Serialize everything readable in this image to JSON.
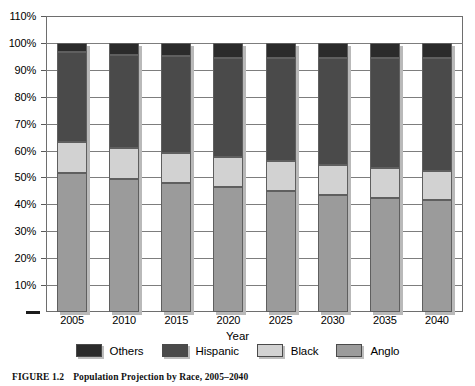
{
  "caption": {
    "number": "FIGURE 1.2",
    "text": "Population Projection by Race, 2005–2040"
  },
  "chart_data": {
    "type": "bar",
    "subtype": "stacked-100-percent",
    "title": "",
    "xlabel": "Year",
    "ylabel": "",
    "categories": [
      "2005",
      "2010",
      "2015",
      "2020",
      "2025",
      "2030",
      "2035",
      "2040"
    ],
    "series": [
      {
        "name": "Anglo",
        "color": "#9b9b9b",
        "values": [
          51.5,
          49.5,
          48.0,
          46.5,
          45.0,
          43.5,
          42.5,
          41.5
        ]
      },
      {
        "name": "Black",
        "color": "#d2d2d2",
        "values": [
          11.5,
          11.5,
          11.0,
          11.0,
          11.0,
          11.0,
          11.0,
          11.0
        ]
      },
      {
        "name": "Hispanic",
        "color": "#4a4a4a",
        "values": [
          33.5,
          34.5,
          36.0,
          37.0,
          38.5,
          40.0,
          41.0,
          42.0
        ]
      },
      {
        "name": "Others",
        "color": "#2b2b2b",
        "values": [
          3.5,
          4.5,
          5.0,
          5.5,
          5.5,
          5.5,
          5.5,
          5.5
        ]
      }
    ],
    "stack_order_bottom_to_top": [
      "Anglo",
      "Black",
      "Hispanic",
      "Others"
    ],
    "legend_order": [
      "Others",
      "Hispanic",
      "Black",
      "Anglo"
    ],
    "ylim": [
      0,
      110
    ],
    "yticks": [
      10,
      20,
      30,
      40,
      50,
      60,
      70,
      80,
      90,
      100,
      110
    ],
    "ytick_labels": [
      "10%",
      "20%",
      "30%",
      "40%",
      "50%",
      "60%",
      "70%",
      "80%",
      "90%",
      "100%",
      "110%"
    ],
    "grid": true,
    "grid_axis": "y",
    "legend_position": "bottom",
    "plot_border": true
  },
  "legend": {
    "items": [
      {
        "label": "Others",
        "color": "#2b2b2b"
      },
      {
        "label": "Hispanic",
        "color": "#4a4a4a"
      },
      {
        "label": "Black",
        "color": "#d2d2d2"
      },
      {
        "label": "Anglo",
        "color": "#9b9b9b"
      }
    ]
  }
}
